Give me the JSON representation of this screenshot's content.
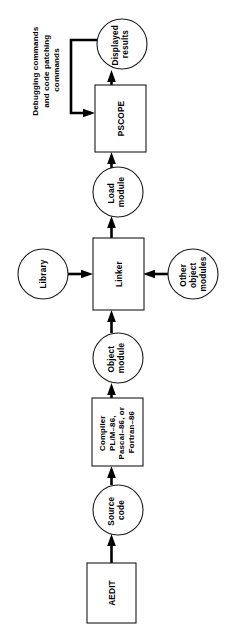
{
  "diagram": {
    "orientation": "rotated-90-ccw",
    "colors": {
      "background": "#ffffff",
      "stroke": "#1a1a1a",
      "arrow": "#000000",
      "text": "#000000"
    },
    "nodes": [
      {
        "id": "aedit",
        "shape": "rect",
        "lines": [
          "AEDIT"
        ]
      },
      {
        "id": "source-code",
        "shape": "circle",
        "lines": [
          "Source",
          "code"
        ]
      },
      {
        "id": "compiler",
        "shape": "rect",
        "lines": [
          "Compiler",
          "PL/M–86,",
          "Pascal–86, or",
          "Fortran–86"
        ]
      },
      {
        "id": "object-module",
        "shape": "circle",
        "lines": [
          "Object",
          "module"
        ]
      },
      {
        "id": "library",
        "shape": "circle",
        "lines": [
          "Library"
        ]
      },
      {
        "id": "linker",
        "shape": "rect",
        "lines": [
          "Linker"
        ]
      },
      {
        "id": "other-object-modules",
        "shape": "circle",
        "lines": [
          "Other",
          "object",
          "modules"
        ]
      },
      {
        "id": "load-module",
        "shape": "circle",
        "lines": [
          "Load",
          "module"
        ]
      },
      {
        "id": "pscope",
        "shape": "rect",
        "lines": [
          "PSCOPE"
        ]
      },
      {
        "id": "displayed-results",
        "shape": "circle",
        "lines": [
          "Displayed",
          "results"
        ]
      }
    ],
    "annotations": [
      {
        "id": "feedback-annotation",
        "lines": [
          "Debugging commands",
          "and code patching",
          "commands"
        ]
      }
    ]
  }
}
